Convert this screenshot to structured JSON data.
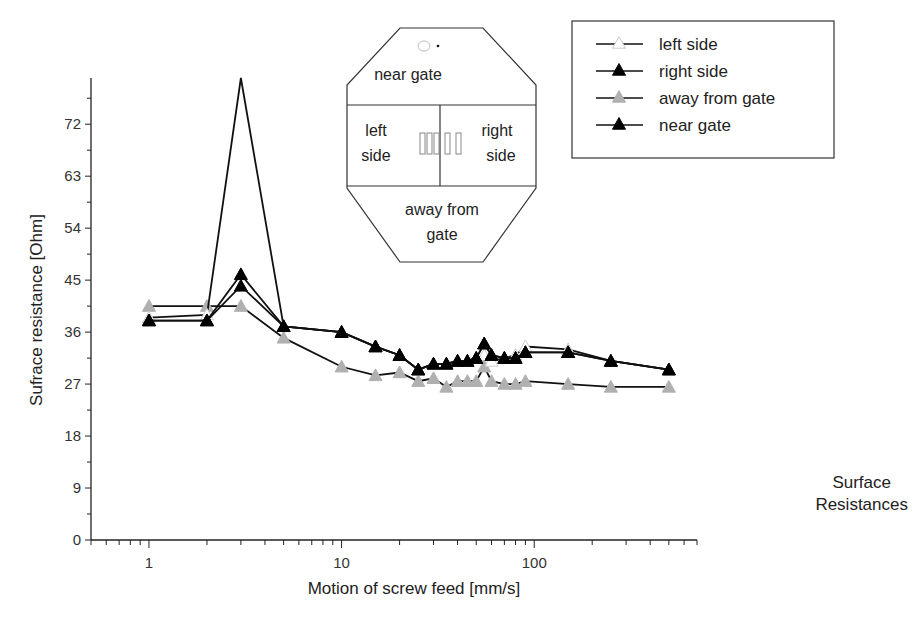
{
  "caption": {
    "line1": "Surface",
    "line2": "Resistances"
  },
  "chart_data": {
    "type": "line",
    "title": "",
    "xlabel": "Motion of screw feed [mm/s]",
    "ylabel": "Sufrace resistance [Ohm]",
    "xscale": "log",
    "xlim": [
      0.5,
      700
    ],
    "ylim": [
      0,
      80
    ],
    "xticks": [
      "1",
      "10",
      "100"
    ],
    "yticks": [
      "0",
      "9",
      "18",
      "27",
      "36",
      "45",
      "54",
      "63",
      "72"
    ],
    "grid": false,
    "legend_position": "top-right",
    "x": [
      1,
      2,
      3,
      5,
      10,
      15,
      20,
      25,
      30,
      35,
      40,
      45,
      50,
      55,
      60,
      70,
      80,
      90,
      150,
      250,
      500
    ],
    "series": [
      {
        "name": "left side",
        "marker": "open-triangle",
        "color": "#ffffff",
        "values": [
          38.5,
          39,
          80,
          37,
          36,
          33.5,
          32,
          29.5,
          30.5,
          30.5,
          31,
          31,
          31.5,
          32,
          31,
          31.5,
          32,
          33.5,
          33,
          31,
          29.5
        ]
      },
      {
        "name": "right side",
        "marker": "filled-triangle",
        "color": "#000000",
        "values": [
          38,
          38,
          44,
          37,
          36,
          33.5,
          32,
          29.5,
          30.5,
          30.5,
          31,
          31,
          31.5,
          34,
          32,
          31.5,
          31.5,
          32.5,
          32.5,
          31,
          29.5
        ]
      },
      {
        "name": "away from gate",
        "marker": "filled-triangle",
        "color": "#b0b0b0",
        "values": [
          40.5,
          40.5,
          40.5,
          35,
          30,
          28.5,
          29,
          27.5,
          28,
          26.5,
          27.5,
          27.5,
          27.5,
          30,
          27.5,
          27,
          27,
          27.5,
          27,
          26.5,
          26.5
        ]
      },
      {
        "name": "near gate",
        "marker": "filled-triangle",
        "color": "#000000",
        "values": [
          38,
          38,
          46,
          37,
          36,
          33.5,
          32,
          29.5,
          30.5,
          30.5,
          31,
          31,
          31.5,
          34,
          32,
          31.5,
          31.5,
          32.5,
          32.5,
          31,
          29.5
        ]
      }
    ],
    "inset_diagram": {
      "top_label": "near gate",
      "left_label": [
        "left",
        "side"
      ],
      "right_label": [
        "right",
        "side"
      ],
      "bottom_label": [
        "away from",
        "gate"
      ]
    }
  }
}
